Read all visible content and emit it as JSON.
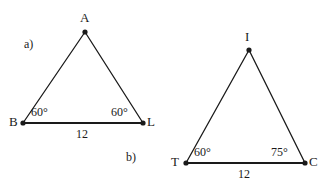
{
  "figure": {
    "background_color": "#ffffff",
    "stroke_color": "#1a1a1a",
    "parts": [
      {
        "id": "a",
        "label": "a)"
      },
      {
        "id": "b",
        "label": "b)"
      }
    ]
  },
  "triangle_a": {
    "name": "triangle-abl",
    "vertices": [
      {
        "id": "A",
        "label": "A"
      },
      {
        "id": "B",
        "label": "B"
      },
      {
        "id": "L",
        "label": "L"
      }
    ],
    "angles": [
      {
        "at": "B",
        "label": "60",
        "degree_symbol": "°",
        "text": "60°"
      },
      {
        "at": "L",
        "label": "60",
        "degree_symbol": "°",
        "text": "60°"
      }
    ],
    "sides": [
      {
        "between": "BL",
        "label": "12"
      }
    ]
  },
  "triangle_b": {
    "name": "triangle-tic",
    "vertices": [
      {
        "id": "I",
        "label": "I"
      },
      {
        "id": "T",
        "label": "T"
      },
      {
        "id": "C",
        "label": "C"
      }
    ],
    "angles": [
      {
        "at": "T",
        "label": "60",
        "degree_symbol": "°",
        "text": "60°"
      },
      {
        "at": "C",
        "label": "75",
        "degree_symbol": "°",
        "text": "75°"
      }
    ],
    "sides": [
      {
        "between": "TC",
        "label": "12"
      }
    ]
  }
}
